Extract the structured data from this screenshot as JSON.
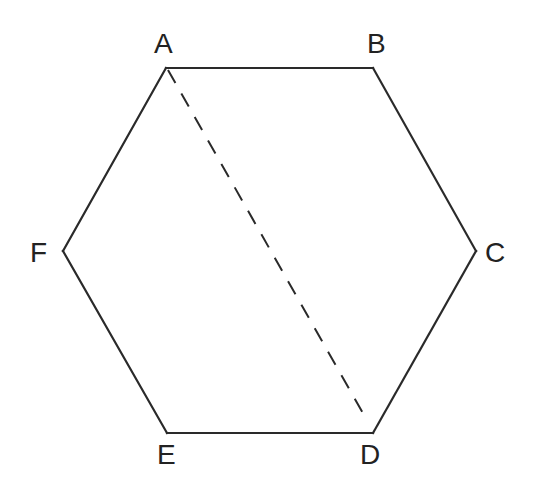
{
  "figure": {
    "type": "regular-hexagon",
    "vertices": [
      "A",
      "B",
      "C",
      "D",
      "E",
      "F"
    ],
    "edges": [
      [
        "A",
        "B"
      ],
      [
        "B",
        "C"
      ],
      [
        "C",
        "D"
      ],
      [
        "D",
        "E"
      ],
      [
        "E",
        "F"
      ],
      [
        "F",
        "A"
      ]
    ],
    "diagonals": [
      {
        "from": "A",
        "to": "D",
        "style": "dashed"
      }
    ],
    "labels": {
      "A": "A",
      "B": "B",
      "C": "C",
      "D": "D",
      "E": "E",
      "F": "F"
    }
  }
}
